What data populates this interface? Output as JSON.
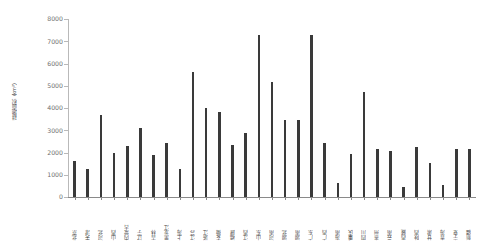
{
  "chart_data": {
    "type": "bar",
    "title": "",
    "subtitle": "",
    "xlabel": "",
    "ylabel": "耕地面积（km²）",
    "ylim": [
      0,
      8000
    ],
    "ytick_labels": [
      "0",
      "1000",
      "2000",
      "3000",
      "4000",
      "5000",
      "6000",
      "7000",
      "8000"
    ],
    "ytick_values": [
      0,
      1000,
      2000,
      3000,
      4000,
      5000,
      6000,
      7000,
      8000
    ],
    "grid": false,
    "legend": null,
    "legend_position": "none",
    "bar_color": "#3a3a3a",
    "axis_color": "#b9b9b9",
    "categories": [
      "北京",
      "天津",
      "河北",
      "山西",
      "内蒙古",
      "辽宁",
      "吉林",
      "黑龙江",
      "上海",
      "江苏",
      "浙江",
      "安徽",
      "福建",
      "江西",
      "山东",
      "河南",
      "湖北",
      "湖南",
      "广东",
      "广西",
      "海南",
      "重庆",
      "四川",
      "贵州",
      "云南",
      "西藏",
      "陕西",
      "甘肃",
      "青海",
      "宁夏",
      "新疆"
    ],
    "values": [
      1600,
      1250,
      3700,
      2000,
      2280,
      3090,
      1870,
      2450,
      1280,
      5620,
      4020,
      3840,
      2350,
      2870,
      7300,
      5180,
      3440,
      3480,
      7290,
      2410,
      640,
      1940,
      4740,
      2160,
      2080,
      430,
      2230,
      1520,
      530,
      2150,
      2150
    ]
  },
  "axis": {
    "y_title": "耕地面积（km²）"
  }
}
